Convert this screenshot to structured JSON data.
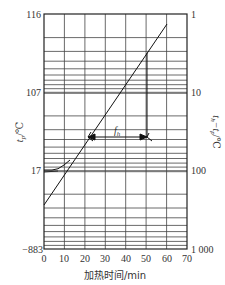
{
  "chart_data": {
    "type": "line",
    "title": "",
    "xlabel": "加热时间/min",
    "ylabel_left": "t_p/℃",
    "ylabel_right": "t_h−t_p/℃",
    "x_ticks": [
      0,
      10,
      20,
      30,
      40,
      50,
      60,
      70
    ],
    "xlim": [
      0,
      70
    ],
    "left_ticks": [
      "116",
      "107",
      "17",
      "−883"
    ],
    "right_ticks": [
      "1",
      "10",
      "100",
      "1 000"
    ],
    "right_scale": "log",
    "ylim_right": [
      1,
      1000
    ],
    "grid": true,
    "series": [
      {
        "name": "heating curve (straight portion)",
        "x": [
          0,
          10,
          20,
          30,
          40,
          50,
          60
        ],
        "values": [
          400,
          170,
          65,
          27,
          11,
          4.3,
          1.7
        ]
      },
      {
        "name": "heating curve (initial lag)",
        "x": [
          0,
          5,
          10,
          13
        ],
        "values": [
          100,
          100,
          95,
          85
        ]
      }
    ],
    "annotations": [
      {
        "label": "f_h",
        "type": "bracket",
        "x_from": 21,
        "x_to": 51,
        "y": 25,
        "note": "one log cycle of straight line"
      }
    ]
  },
  "labels": {
    "left_ticks": [
      "116",
      "107",
      "17",
      "−883"
    ],
    "right_ticks": [
      "1",
      "10",
      "100",
      "1 000"
    ],
    "x_ticks": [
      "0",
      "10",
      "20",
      "30",
      "40",
      "50",
      "60",
      "70"
    ],
    "ylabel_left_main": "t",
    "ylabel_left_sub": "p",
    "ylabel_left_unit": "/℃",
    "ylabel_right_main": "t",
    "ylabel_right_sub1": "h",
    "ylabel_right_mid": "−t",
    "ylabel_right_sub2": "p",
    "ylabel_right_unit": "/℃",
    "xlabel": "加热时间/min",
    "fh_main": "f",
    "fh_sub": "h"
  }
}
